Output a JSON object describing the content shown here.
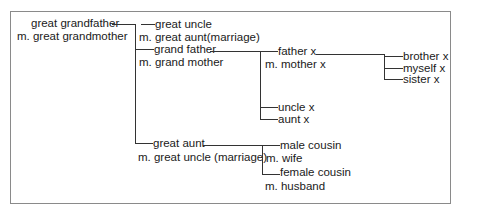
{
  "tree": {
    "root": {
      "name": "great grandfather",
      "spouse": "m. great grandmother"
    },
    "gen2": {
      "great_uncle": {
        "name": "great uncle",
        "spouse": "m. great aunt(marriage)"
      },
      "grand_father": {
        "name": "grand father",
        "spouse": "m. grand mother"
      },
      "great_aunt": {
        "name": "great aunt",
        "spouse": "m. great uncle (marriage)"
      }
    },
    "gen3": {
      "father": {
        "name": "father x",
        "spouse": "m. mother x"
      },
      "uncle": {
        "name": "uncle x"
      },
      "aunt": {
        "name": "aunt x"
      },
      "male_cousin": {
        "name": "male cousin",
        "spouse": "m. wife"
      },
      "female_cousin": {
        "name": "female cousin",
        "spouse": "m. husband"
      }
    },
    "gen4": {
      "brother": {
        "name": "brother x"
      },
      "myself": {
        "name": "myself x"
      },
      "sister": {
        "name": "sister x"
      }
    }
  },
  "colors": {
    "line": "#333333",
    "frame": "#8a8a8a",
    "text": "#1a1a1a",
    "background": "#ffffff"
  }
}
